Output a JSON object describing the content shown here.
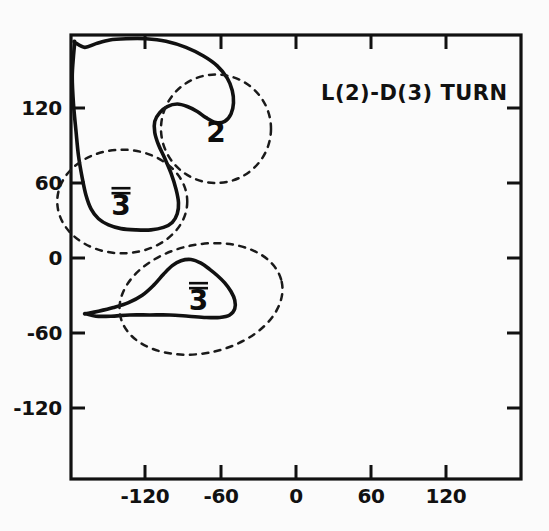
{
  "figure": {
    "title": "L(2)-D(3)  TURN",
    "background_color": "#fbfbfb",
    "ink_color": "#111111"
  },
  "chart_data": {
    "type": "line",
    "title": "L(2)-D(3)  TURN",
    "xlabel": "",
    "ylabel": "",
    "xlim": [
      -180,
      180
    ],
    "ylim": [
      -180,
      180
    ],
    "grid": false,
    "legend_position": "none",
    "x_ticks": [
      -120,
      -60,
      0,
      60,
      120
    ],
    "x_tick_labels": [
      "-120",
      "-60",
      "0",
      "60",
      "120"
    ],
    "y_ticks": [
      -120,
      -60,
      0,
      60,
      120
    ],
    "y_tick_labels": [
      "-120",
      "-60",
      "0",
      "60",
      "120"
    ],
    "series": [
      {
        "name": "upper-allowed-region",
        "style": "solid",
        "closed": true,
        "comment": "Large L-shaped / hook-shaped allowed conformational region spanning the upper-left quadrant",
        "points": [
          [
            -177,
            174
          ],
          [
            -169,
            170
          ],
          [
            -160,
            173
          ],
          [
            -149,
            176
          ],
          [
            -136,
            177
          ],
          [
            -120,
            177
          ],
          [
            -104,
            175
          ],
          [
            -88,
            170
          ],
          [
            -74,
            163
          ],
          [
            -63,
            155
          ],
          [
            -55,
            145
          ],
          [
            -51,
            135
          ],
          [
            -50,
            125
          ],
          [
            -52,
            116
          ],
          [
            -57,
            110
          ],
          [
            -64,
            109
          ],
          [
            -72,
            113
          ],
          [
            -79,
            118
          ],
          [
            -87,
            122
          ],
          [
            -95,
            124
          ],
          [
            -103,
            122
          ],
          [
            -109,
            117
          ],
          [
            -113,
            110
          ],
          [
            -113,
            101
          ],
          [
            -110,
            91
          ],
          [
            -105,
            80
          ],
          [
            -100,
            68
          ],
          [
            -96,
            55
          ],
          [
            -94,
            44
          ],
          [
            -95,
            35
          ],
          [
            -99,
            28
          ],
          [
            -106,
            24
          ],
          [
            -116,
            22
          ],
          [
            -128,
            22
          ],
          [
            -140,
            23
          ],
          [
            -150,
            26
          ],
          [
            -158,
            31
          ],
          [
            -164,
            39
          ],
          [
            -168,
            50
          ],
          [
            -171,
            64
          ],
          [
            -174,
            82
          ],
          [
            -176,
            102
          ],
          [
            -178,
            124
          ],
          [
            -179,
            146
          ],
          [
            -178,
            163
          ],
          [
            -177,
            174
          ]
        ]
      },
      {
        "name": "lower-allowed-region",
        "style": "solid",
        "closed": true,
        "comment": "Smaller crescent-shaped allowed conformational region below the zero line",
        "points": [
          [
            -168,
            -46
          ],
          [
            -158,
            -44
          ],
          [
            -146,
            -41
          ],
          [
            -134,
            -37
          ],
          [
            -123,
            -31
          ],
          [
            -114,
            -23
          ],
          [
            -106,
            -14
          ],
          [
            -99,
            -7
          ],
          [
            -92,
            -3
          ],
          [
            -84,
            -2
          ],
          [
            -76,
            -5
          ],
          [
            -69,
            -10
          ],
          [
            -63,
            -15
          ],
          [
            -57,
            -21
          ],
          [
            -52,
            -28
          ],
          [
            -49,
            -35
          ],
          [
            -49,
            -42
          ],
          [
            -53,
            -47
          ],
          [
            -61,
            -49
          ],
          [
            -72,
            -49
          ],
          [
            -86,
            -48
          ],
          [
            -101,
            -47
          ],
          [
            -117,
            -47
          ],
          [
            -133,
            -47
          ],
          [
            -148,
            -48
          ],
          [
            -160,
            -48
          ],
          [
            -168,
            -46
          ]
        ]
      },
      {
        "name": "region-2-marker",
        "style": "dashed",
        "closed": true,
        "shape": "ellipse",
        "center": [
          -64,
          104
        ],
        "radii": [
          22,
          22
        ],
        "rotation": 0
      },
      {
        "name": "region-3bar-upper-marker",
        "style": "dashed",
        "closed": true,
        "shape": "ellipse",
        "center": [
          -139,
          45
        ],
        "radii": [
          26,
          21
        ],
        "rotation": 0
      },
      {
        "name": "region-3bar-lower-marker",
        "style": "dashed",
        "closed": true,
        "shape": "ellipse",
        "center": [
          -76,
          -34
        ],
        "radii": [
          33,
          22
        ],
        "rotation": -12
      }
    ],
    "annotations": [
      {
        "text": "2",
        "overbar": false,
        "x": -64,
        "y": 101
      },
      {
        "text": "3",
        "overbar": true,
        "x": -140,
        "y": 42
      },
      {
        "text": "3",
        "overbar": true,
        "x": -78,
        "y": -35
      }
    ]
  }
}
